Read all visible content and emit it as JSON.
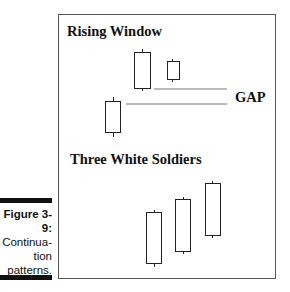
{
  "figure": {
    "number": "Figure 3-9:",
    "caption_lines": [
      "Continua-",
      "tion",
      "patterns."
    ]
  },
  "patterns": [
    {
      "title": "Rising Window",
      "annotation": "GAP"
    },
    {
      "title": "Three White Soldiers"
    }
  ]
}
